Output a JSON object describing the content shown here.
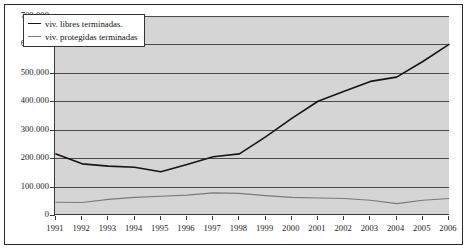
{
  "chart_data": {
    "type": "line",
    "title": "",
    "subtitle": "",
    "xlabel": "",
    "ylabel": "",
    "grid": true,
    "legend_position": "top-left-inside",
    "xlim": [
      1991,
      2006
    ],
    "ylim": [
      0,
      700000
    ],
    "ytick_step": 100000,
    "categories": [
      "1991",
      "1992",
      "1993",
      "1994",
      "1995",
      "1996",
      "1997",
      "1998",
      "1999",
      "2000",
      "2001",
      "2002",
      "2003",
      "2004",
      "2005",
      "2006"
    ],
    "ytick_labels": [
      "0",
      "100.000",
      "200.000",
      "300.000",
      "400.000",
      "500.000",
      "600.000",
      "700.000"
    ],
    "ytick_values": [
      0,
      100000,
      200000,
      300000,
      400000,
      500000,
      600000,
      700000
    ],
    "series": [
      {
        "name": "viv. libres terminadas.",
        "color": "#151515",
        "width": 1.6,
        "values": [
          215000,
          180000,
          172000,
          168000,
          152000,
          178000,
          205000,
          215000,
          275000,
          340000,
          400000,
          435000,
          470000,
          485000,
          540000,
          600000
        ]
      },
      {
        "name": "viv. protegidas terminadas",
        "color": "#7a7a7a",
        "width": 1.1,
        "values": [
          45000,
          44000,
          55000,
          62000,
          66000,
          70000,
          78000,
          76000,
          68000,
          62000,
          60000,
          58000,
          52000,
          40000,
          52000,
          58000
        ]
      }
    ]
  },
  "legend": {
    "entries": [
      {
        "label": "viv. libres terminadas.",
        "swatch": "line-swatch-dark"
      },
      {
        "label": "viv. protegidas terminadas",
        "swatch": "line-swatch-gray"
      }
    ]
  },
  "colors": {
    "plot_background": "#d5d5d5",
    "frame": "#2a2a2a",
    "gridline": "#4a4a4a",
    "series_libres": "#151515",
    "series_protegidas": "#7a7a7a",
    "page_background": "#ffffff"
  }
}
